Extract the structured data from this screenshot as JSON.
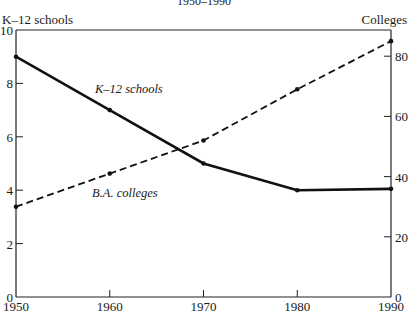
{
  "chart_data": {
    "type": "line",
    "title": "1950–1990",
    "xlabel": "",
    "ylabel_left": "K–12 schools",
    "ylabel_right": "Colleges",
    "x": [
      1950,
      1960,
      1970,
      1980,
      1990
    ],
    "x_ticks": [
      "1950",
      "1960",
      "1970",
      "1980",
      "1990"
    ],
    "y_left_ticks": [
      "0",
      "2",
      "4",
      "6",
      "8",
      "10"
    ],
    "y_right_ticks": [
      "0",
      "20",
      "40",
      "60",
      "80"
    ],
    "ylim_left": [
      0,
      10
    ],
    "ylim_right": [
      0,
      88.7
    ],
    "grid": false,
    "series": [
      {
        "name": "K–12 schools",
        "axis": "left",
        "style": "solid",
        "values": [
          9.0,
          7.0,
          5.0,
          4.0,
          4.05
        ]
      },
      {
        "name": "B.A. colleges",
        "axis": "right",
        "style": "dashed",
        "values": [
          30,
          41,
          52,
          69,
          85
        ]
      }
    ]
  }
}
